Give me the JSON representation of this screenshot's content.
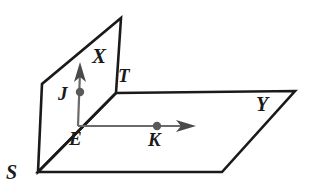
{
  "figure": {
    "type": "geometry-diagram",
    "background_color": "#ffffff",
    "plane_edge_color": "#1a1a1a",
    "ray_color": "#5f5f5f",
    "label_color": "#1a1a1a"
  },
  "labels": {
    "S": "S",
    "X": "X",
    "T": "T",
    "J": "J",
    "E": "E",
    "K": "K",
    "Y": "Y"
  },
  "planes": [
    {
      "name": "vertical-plane",
      "label": "X",
      "vertices": [
        [
          38,
          172
        ],
        [
          42,
          84
        ],
        [
          121,
          18
        ],
        [
          116,
          93
        ]
      ]
    },
    {
      "name": "horizontal-plane",
      "label": "Y",
      "vertices": [
        [
          38,
          172
        ],
        [
          116,
          93
        ],
        [
          295,
          91
        ],
        [
          222,
          172
        ]
      ]
    }
  ],
  "rays": [
    {
      "name": "ray-EJ-vertical",
      "from_label": "E",
      "through_label": "J",
      "start": [
        78,
        126
      ],
      "end": [
        80,
        62
      ],
      "arrow": true
    },
    {
      "name": "ray-EK-horizontal",
      "from_label": "E",
      "through_label": "K",
      "start": [
        78,
        126
      ],
      "end": [
        196,
        126
      ],
      "arrow": true
    }
  ],
  "points": [
    {
      "name": "point-J",
      "label": "J",
      "cx": 80,
      "cy": 92,
      "r": 4.2
    },
    {
      "name": "point-K",
      "label": "K",
      "cx": 157,
      "cy": 126,
      "r": 4.2
    }
  ]
}
